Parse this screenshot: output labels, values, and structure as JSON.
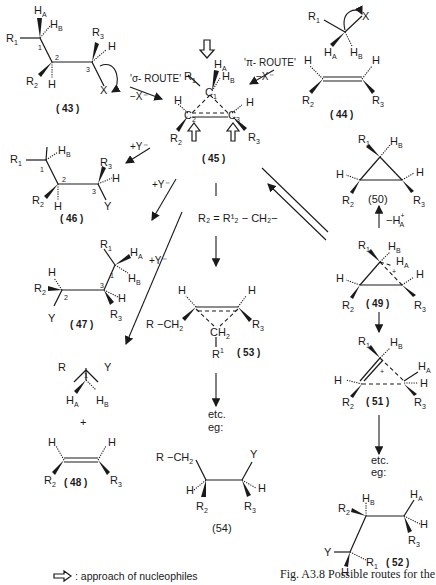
{
  "figure": {
    "caption_line1": "Fig. A3.8 Possible routes for the",
    "legend_text": ": approach of nucleophiles",
    "legend_icon": "open-arrow-icon"
  },
  "routes": {
    "sigma": "'σ- ROUTE'",
    "pi": "'π- ROUTE'",
    "minus_x": "−X⁻",
    "plus_y": "+Y⁻",
    "minus_ha": "−H",
    "substitution": "R₂ = R¹₂ − CH₂−",
    "etc": "etc.",
    "eg": "eg:"
  },
  "compounds": [
    {
      "id": "43",
      "label": "( 43 )"
    },
    {
      "id": "44",
      "label": "( 44 )"
    },
    {
      "id": "45",
      "label": "( 45 )"
    },
    {
      "id": "46",
      "label": "( 46 )"
    },
    {
      "id": "47",
      "label": "( 47 )"
    },
    {
      "id": "48",
      "label": "( 48 )"
    },
    {
      "id": "49",
      "label": "( 49 )"
    },
    {
      "id": "50",
      "label": "(50)"
    },
    {
      "id": "51",
      "label": "( 51 )"
    },
    {
      "id": "52",
      "label": "( 52 )"
    },
    {
      "id": "53",
      "label": "( 53 )"
    },
    {
      "id": "54",
      "label": "(54)"
    }
  ],
  "atoms": {
    "R1": "R",
    "R2": "R",
    "R3": "R",
    "R": "R",
    "H": "H",
    "HA": "H",
    "HB": "H",
    "X": "X",
    "Y": "Y",
    "C": "C",
    "CH2": "CH",
    "R1CH2": "R  −CH",
    "sub1": "1",
    "sub2": "2",
    "sub3": "3",
    "subA": "A",
    "subB": "B",
    "sup1": "1",
    "plus": "+"
  }
}
